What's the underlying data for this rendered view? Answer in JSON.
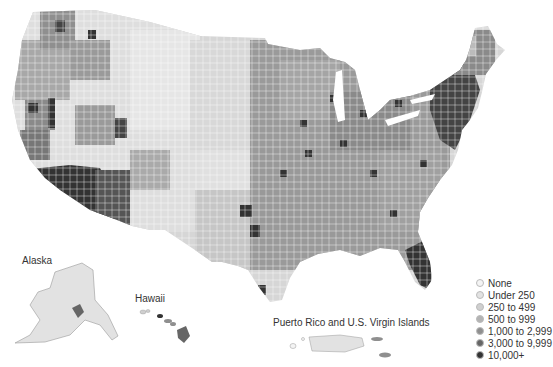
{
  "map": {
    "type": "choropleth",
    "subject": "United States counties",
    "palette_grayscale": true
  },
  "insets": {
    "alaska": {
      "label": "Alaska"
    },
    "hawaii": {
      "label": "Hawaii"
    },
    "puerto_rico": {
      "label": "Puerto Rico and U.S. Virgin Islands"
    }
  },
  "legend": {
    "items": [
      {
        "label": "None",
        "color": "#f4f4f4"
      },
      {
        "label": "Under 250",
        "color": "#e2e2e2"
      },
      {
        "label": "250 to 499",
        "color": "#cfcfcf"
      },
      {
        "label": "500 to 999",
        "color": "#b3b3b3"
      },
      {
        "label": "1,000 to 2,999",
        "color": "#8f8f8f"
      },
      {
        "label": "3,000 to 9,999",
        "color": "#666666"
      },
      {
        "label": "10,000+",
        "color": "#333333"
      }
    ]
  }
}
